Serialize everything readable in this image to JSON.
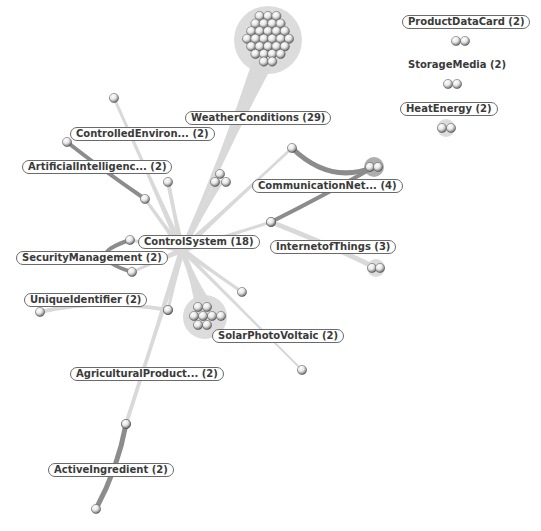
{
  "graph": {
    "hub": {
      "id": "control-system",
      "label": "ControlSystem (18)",
      "x": 182,
      "y": 250
    },
    "colors": {
      "background": "#ffffff",
      "edge_light": "#d9d9d9",
      "edge_dark": "#8c8c8c",
      "halo": "#dcdcdc",
      "label_border": "#6a6a6a",
      "label_text": "#3a3a3a"
    },
    "clusters": [
      {
        "id": "weather-conditions",
        "label": "WeatherConditions (29)",
        "count": 29,
        "label_pos": [
          185,
          111
        ],
        "center": [
          268,
          40
        ],
        "radius": 30,
        "dark": false
      },
      {
        "id": "controlled-environ",
        "label": "ControlledEnviron... (2)",
        "count": 2,
        "label_pos": [
          70,
          127
        ],
        "balls": [
          [
            114,
            98
          ],
          [
            168,
            182
          ]
        ],
        "dark": false
      },
      {
        "id": "artificial-intelligence",
        "label": "ArtificialIntelligenc... (2)",
        "count": 2,
        "label_pos": [
          22,
          160
        ],
        "balls": [
          [
            67,
            142
          ],
          [
            145,
            199
          ]
        ],
        "dark": true
      },
      {
        "id": "communication-net",
        "label": "CommunicationNet... (4)",
        "count": 4,
        "label_pos": [
          252,
          179
        ],
        "balls": [
          [
            292,
            148
          ],
          [
            370,
            167
          ],
          [
            378,
            167
          ],
          [
            271,
            222
          ]
        ],
        "dark": true
      },
      {
        "id": "internet-of-things",
        "label": "InternetofThings (3)",
        "count": 3,
        "label_pos": [
          270,
          240
        ],
        "balls": [
          [
            271,
            222
          ],
          [
            372,
            268
          ],
          [
            380,
            268
          ]
        ],
        "dark": false
      },
      {
        "id": "security-management",
        "label": "SecurityManagement (2)",
        "count": 2,
        "label_pos": [
          16,
          251
        ],
        "balls": [
          [
            130,
            240
          ],
          [
            132,
            272
          ]
        ],
        "dark": true
      },
      {
        "id": "unique-identifier",
        "label": "UniqueIdentifier (2)",
        "count": 2,
        "label_pos": [
          24,
          293
        ],
        "balls": [
          [
            40,
            312
          ],
          [
            168,
            310
          ]
        ],
        "dark": false
      },
      {
        "id": "solar-photovoltaic",
        "label": "SolarPhotoVoltaic (2)",
        "count": 2,
        "label_pos": [
          212,
          329
        ],
        "center": [
          205,
          317
        ],
        "radius": 18,
        "dark": false
      },
      {
        "id": "agricultural-product",
        "label": "AgriculturalProduct... (2)",
        "count": 2,
        "label_pos": [
          70,
          367
        ],
        "balls": [
          [
            126,
            424
          ],
          [
            168,
            310
          ]
        ],
        "dark": false
      },
      {
        "id": "active-ingredient",
        "label": "ActiveIngredient (2)",
        "count": 2,
        "label_pos": [
          48,
          463
        ],
        "balls": [
          [
            126,
            424
          ],
          [
            96,
            509
          ]
        ],
        "dark": true
      }
    ],
    "extra_balls": [
      [
        242,
        292
      ],
      [
        302,
        370
      ],
      [
        220,
        174
      ],
      [
        215,
        182
      ],
      [
        226,
        182
      ]
    ],
    "isolated": [
      {
        "id": "product-data-card",
        "label": "ProductDataCard (2)",
        "label_pos": [
          402,
          15
        ],
        "balls": [
          [
            456,
            41
          ],
          [
            465,
            41
          ]
        ],
        "bordered": true
      },
      {
        "id": "storage-media",
        "label": "StorageMedia (2)",
        "label_pos": [
          402,
          58
        ],
        "balls": [
          [
            448,
            84
          ],
          [
            457,
            84
          ]
        ],
        "bordered": false
      },
      {
        "id": "heat-energy",
        "label": "HeatEnergy (2)",
        "label_pos": [
          400,
          102
        ],
        "balls": [
          [
            442,
            128
          ],
          [
            451,
            128
          ]
        ],
        "bordered": true
      }
    ]
  }
}
